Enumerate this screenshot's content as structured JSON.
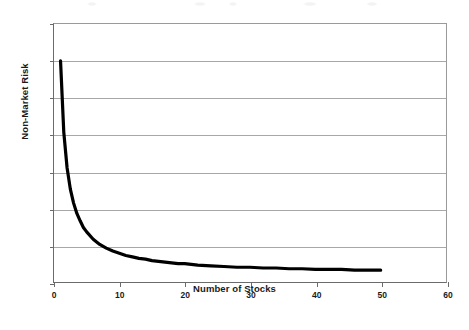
{
  "chart_data": {
    "type": "line",
    "title": "",
    "subtitle": "",
    "xlabel": "Number of Stocks",
    "ylabel": "Non-Market Risk",
    "xlim": [
      0,
      60
    ],
    "ylim": [
      0,
      35
    ],
    "x_ticks": [
      0,
      10,
      20,
      30,
      40,
      50,
      60
    ],
    "x_tick_labels": [
      "0",
      "10",
      "20",
      "30",
      "40",
      "50",
      "60"
    ],
    "y_ticks": [
      0,
      5,
      10,
      15,
      20,
      25,
      30,
      35
    ],
    "y_tick_labels": [
      "0%",
      "5%",
      "10%",
      "15%",
      "20%",
      "25%",
      "30%",
      "35%"
    ],
    "grid": "horizontal",
    "legend": "none",
    "annotations": [],
    "series": [
      {
        "name": "Non-Market Risk",
        "color": "#000000",
        "line_width": 3,
        "x": [
          1,
          1.5,
          2,
          2.5,
          3,
          3.5,
          4,
          4.5,
          5,
          6,
          7,
          8,
          9,
          10,
          11,
          12,
          13,
          14,
          15,
          16,
          17,
          18,
          19,
          20,
          22,
          24,
          26,
          28,
          30,
          32,
          34,
          36,
          38,
          40,
          42,
          44,
          46,
          48,
          50
        ],
        "y": [
          30.0,
          20.3,
          15.5,
          12.6,
          10.7,
          9.3,
          8.3,
          7.4,
          6.8,
          5.8,
          5.1,
          4.6,
          4.2,
          3.9,
          3.6,
          3.4,
          3.2,
          3.1,
          2.9,
          2.8,
          2.7,
          2.6,
          2.5,
          2.5,
          2.3,
          2.2,
          2.1,
          2.0,
          2.0,
          1.9,
          1.9,
          1.8,
          1.8,
          1.7,
          1.7,
          1.7,
          1.6,
          1.6,
          1.6
        ],
        "y_unit": "%",
        "formula_note": "approx 1% + 29%/n"
      }
    ]
  },
  "figure": {
    "background_color": "#ffffff",
    "axis_color": "#6b6b6b",
    "grid_color": "#a8a8a8",
    "text_color": "#1a1a1a"
  }
}
